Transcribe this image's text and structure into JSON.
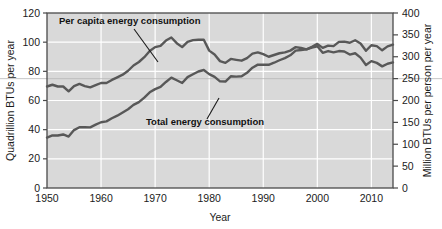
{
  "chart_data": {
    "type": "line",
    "title": "",
    "xlabel": "Year",
    "ylabel": "Quadrillion BTUs per year",
    "ylabel_right": "Million BTUs per person per year",
    "xlim": [
      1950,
      2014
    ],
    "ylim": [
      0,
      120
    ],
    "ylim_right": [
      0,
      400
    ],
    "xticks": [
      1950,
      1960,
      1970,
      1980,
      1990,
      2000,
      2010
    ],
    "xticklabels": [
      "1950",
      "1960",
      "1970",
      "1980",
      "1990",
      "2000",
      "2010"
    ],
    "yticks": [
      0,
      20,
      40,
      60,
      80,
      100,
      120
    ],
    "yticklabels": [
      "0",
      "20",
      "40",
      "60",
      "80",
      "100",
      "120"
    ],
    "yticks_right": [
      0,
      50,
      100,
      150,
      200,
      250,
      300,
      350,
      400
    ],
    "yticklabels_right": [
      "0",
      "50",
      "100",
      "150",
      "200",
      "250",
      "300",
      "350",
      "400"
    ],
    "grid": true,
    "grid_color": "#ffffff",
    "plot_bg": "#d9d9d9",
    "line_color": "#585858",
    "legend_position": "annotations-inline",
    "x": [
      1950,
      1951,
      1952,
      1953,
      1954,
      1955,
      1956,
      1957,
      1958,
      1959,
      1960,
      1961,
      1962,
      1963,
      1964,
      1965,
      1966,
      1967,
      1968,
      1969,
      1970,
      1971,
      1972,
      1973,
      1974,
      1975,
      1976,
      1977,
      1978,
      1979,
      1980,
      1981,
      1982,
      1983,
      1984,
      1985,
      1986,
      1987,
      1988,
      1989,
      1990,
      1991,
      1992,
      1993,
      1994,
      1995,
      1996,
      1997,
      1998,
      1999,
      2000,
      2001,
      2002,
      2003,
      2004,
      2005,
      2006,
      2007,
      2008,
      2009,
      2010,
      2011,
      2012,
      2013,
      2014
    ],
    "series": [
      {
        "name": "Per capita energy consumption",
        "axis": "right",
        "units": "Million BTUs per person per year",
        "values": [
          232,
          236,
          232,
          232,
          221,
          233,
          238,
          233,
          230,
          235,
          240,
          240,
          247,
          253,
          259,
          268,
          280,
          288,
          299,
          313,
          322,
          325,
          337,
          344,
          331,
          322,
          334,
          338,
          339,
          339,
          314,
          305,
          290,
          286,
          295,
          293,
          291,
          297,
          307,
          310,
          306,
          300,
          304,
          308,
          310,
          314,
          322,
          320,
          317,
          321,
          324,
          309,
          313,
          310,
          313,
          312,
          305,
          308,
          298,
          281,
          290,
          286,
          278,
          284,
          287
        ]
      },
      {
        "name": "Total energy consumption",
        "axis": "left",
        "units": "Quadrillion BTUs per year",
        "values": [
          34.6,
          36.1,
          36.0,
          36.7,
          35.3,
          39.7,
          41.7,
          41.7,
          41.6,
          43.5,
          45.1,
          45.7,
          47.8,
          49.6,
          51.8,
          54.0,
          57.0,
          58.9,
          62.0,
          65.6,
          67.8,
          69.3,
          72.7,
          75.7,
          73.9,
          72.0,
          76.0,
          78.0,
          79.9,
          80.9,
          78.1,
          76.2,
          73.1,
          73.0,
          76.6,
          76.4,
          76.6,
          79.0,
          82.5,
          84.6,
          84.5,
          84.5,
          85.9,
          87.6,
          89.1,
          91.0,
          94.2,
          94.6,
          95.1,
          96.8,
          98.8,
          96.1,
          97.6,
          97.3,
          100.2,
          100.4,
          99.6,
          101.3,
          99.1,
          94.1,
          97.9,
          97.3,
          94.4,
          97.1,
          98.3
        ]
      }
    ],
    "annotations": [
      {
        "text": "Per capita energy consumption",
        "label_x": 59,
        "label_y": 24,
        "leader_from_x": 134,
        "leader_from_y": 29,
        "leader_to_x": 158,
        "leader_to_y": 62
      },
      {
        "text": "Total energy consumption",
        "label_x": 146,
        "label_y": 125,
        "leader_from_x": 207,
        "leader_from_y": 119,
        "leader_to_x": 219,
        "leader_to_y": 98
      }
    ]
  },
  "axes": {
    "left_title": "Quadrillion BTUs per year",
    "right_title": "Million BTUs per person per year",
    "x_title": "Year"
  }
}
